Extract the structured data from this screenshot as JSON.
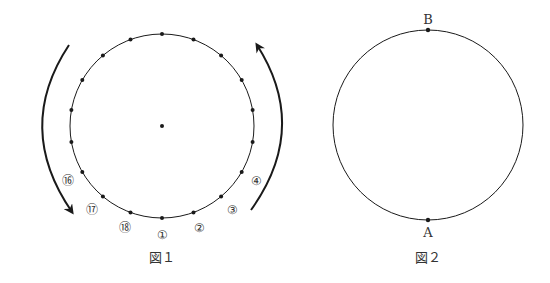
{
  "figure1": {
    "caption": "図１",
    "center": [
      162,
      126
    ],
    "radius": 92,
    "point_count": 18,
    "point_labels": [
      {
        "index": 1,
        "text": "①"
      },
      {
        "index": 2,
        "text": "②"
      },
      {
        "index": 3,
        "text": "③"
      },
      {
        "index": 4,
        "text": "④"
      },
      {
        "index": 16,
        "text": "⑯"
      },
      {
        "index": 17,
        "text": "⑰"
      },
      {
        "index": 18,
        "text": "⑱"
      }
    ],
    "arrows": [
      {
        "side": "left",
        "direction": "counterclockwise-down"
      },
      {
        "side": "right",
        "direction": "up"
      }
    ]
  },
  "figure2": {
    "caption": "図２",
    "center": [
      428,
      125
    ],
    "radius": 95,
    "points": [
      {
        "name": "B",
        "position": "top"
      },
      {
        "name": "A",
        "position": "bottom"
      }
    ]
  },
  "colors": {
    "stroke": "#1a1a1a",
    "text": "#333333"
  }
}
